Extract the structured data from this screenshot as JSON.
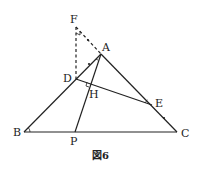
{
  "figure": {
    "caption": "図6",
    "points": {
      "F": {
        "label": "F",
        "x": 76,
        "y": 27
      },
      "A": {
        "label": "A",
        "x": 101,
        "y": 54
      },
      "D": {
        "label": "D",
        "x": 76,
        "y": 79
      },
      "H": {
        "label": "H",
        "x": 90,
        "y": 83
      },
      "E": {
        "label": "E",
        "x": 152,
        "y": 105
      },
      "B": {
        "label": "B",
        "x": 24,
        "y": 132
      },
      "C": {
        "label": "C",
        "x": 177,
        "y": 132
      },
      "P": {
        "label": "P",
        "x": 75,
        "y": 132
      }
    },
    "segments": [
      {
        "from": "B",
        "to": "C",
        "style": "solid"
      },
      {
        "from": "A",
        "to": "B",
        "style": "solid"
      },
      {
        "from": "A",
        "to": "C",
        "style": "solid"
      },
      {
        "from": "A",
        "to": "P",
        "style": "solid"
      },
      {
        "from": "D",
        "to": "E",
        "style": "solid"
      },
      {
        "from": "F",
        "to": "D",
        "style": "dashed"
      },
      {
        "from": "F",
        "to": "A",
        "style": "dashed"
      }
    ],
    "marks": {
      "equal_angle": [
        "angle ABC",
        "angle DEA"
      ],
      "right_angle": [
        "angle AHD",
        "angle DFA"
      ],
      "equal_segments": [
        "FA",
        "AD",
        "EC"
      ]
    }
  }
}
